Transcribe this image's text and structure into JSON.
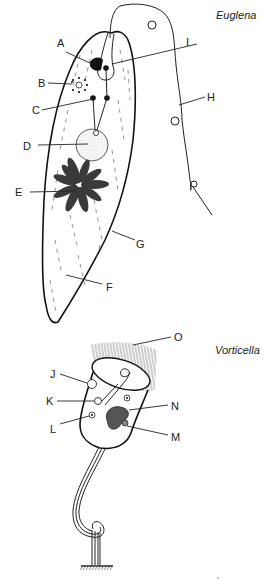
{
  "diagram": {
    "type": "labeled biological illustration",
    "organisms": [
      {
        "title": "Euglena",
        "labels": [
          {
            "id": "A",
            "text": "A"
          },
          {
            "id": "B",
            "text": "B"
          },
          {
            "id": "C",
            "text": "C"
          },
          {
            "id": "D",
            "text": "D"
          },
          {
            "id": "E",
            "text": "E"
          },
          {
            "id": "F",
            "text": "F"
          },
          {
            "id": "G",
            "text": "G"
          },
          {
            "id": "H",
            "text": "H"
          },
          {
            "id": "I",
            "text": "I"
          }
        ]
      },
      {
        "title": "Vorticella",
        "labels": [
          {
            "id": "J",
            "text": "J"
          },
          {
            "id": "K",
            "text": "K"
          },
          {
            "id": "L",
            "text": "L"
          },
          {
            "id": "M",
            "text": "M"
          },
          {
            "id": "N",
            "text": "N"
          },
          {
            "id": "O",
            "text": "O"
          }
        ]
      }
    ],
    "colors": {
      "ink": "#222222",
      "background": "#ffffff",
      "stipple": "#9a9a9a"
    }
  }
}
